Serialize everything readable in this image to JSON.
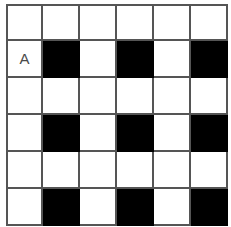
{
  "figure": {
    "kind": "checkerboard-grid",
    "columns": 6,
    "rows": 6,
    "cell_size_px": 37,
    "origin_x_px": 6,
    "origin_y_px": 4,
    "line_width_px": 2,
    "clipped_bottom_row": true
  },
  "colors": {
    "background": "#ffffff",
    "gridline": "#555555",
    "filled_cell": "#000000",
    "empty_cell": "#ffffff",
    "label_text": "#4a4a4a"
  },
  "chart_data": {
    "type": "heatmap",
    "title": "",
    "xlabel": "",
    "ylabel": "",
    "x": [
      1,
      2,
      3,
      4,
      5,
      6
    ],
    "y": [
      1,
      2,
      3,
      4,
      5,
      6
    ],
    "legend": [],
    "grid": true,
    "note": "1 = filled (black) cell, 0 = empty (white) cell; rows listed top to bottom",
    "values": [
      [
        0,
        0,
        0,
        0,
        0,
        0
      ],
      [
        0,
        1,
        0,
        1,
        0,
        1
      ],
      [
        0,
        0,
        0,
        0,
        0,
        0
      ],
      [
        0,
        1,
        0,
        1,
        0,
        1
      ],
      [
        0,
        0,
        0,
        0,
        0,
        0
      ],
      [
        0,
        1,
        0,
        1,
        0,
        1
      ]
    ]
  },
  "annotations": [
    {
      "label": "A",
      "row": 2,
      "col": 1
    }
  ],
  "cells": [
    [
      {
        "filled": false,
        "label": ""
      },
      {
        "filled": false,
        "label": ""
      },
      {
        "filled": false,
        "label": ""
      },
      {
        "filled": false,
        "label": ""
      },
      {
        "filled": false,
        "label": ""
      },
      {
        "filled": false,
        "label": ""
      }
    ],
    [
      {
        "filled": false,
        "label": "A"
      },
      {
        "filled": true,
        "label": ""
      },
      {
        "filled": false,
        "label": ""
      },
      {
        "filled": true,
        "label": ""
      },
      {
        "filled": false,
        "label": ""
      },
      {
        "filled": true,
        "label": ""
      }
    ],
    [
      {
        "filled": false,
        "label": ""
      },
      {
        "filled": false,
        "label": ""
      },
      {
        "filled": false,
        "label": ""
      },
      {
        "filled": false,
        "label": ""
      },
      {
        "filled": false,
        "label": ""
      },
      {
        "filled": false,
        "label": ""
      }
    ],
    [
      {
        "filled": false,
        "label": ""
      },
      {
        "filled": true,
        "label": ""
      },
      {
        "filled": false,
        "label": ""
      },
      {
        "filled": true,
        "label": ""
      },
      {
        "filled": false,
        "label": ""
      },
      {
        "filled": true,
        "label": ""
      }
    ],
    [
      {
        "filled": false,
        "label": ""
      },
      {
        "filled": false,
        "label": ""
      },
      {
        "filled": false,
        "label": ""
      },
      {
        "filled": false,
        "label": ""
      },
      {
        "filled": false,
        "label": ""
      },
      {
        "filled": false,
        "label": ""
      }
    ],
    [
      {
        "filled": false,
        "label": ""
      },
      {
        "filled": true,
        "label": ""
      },
      {
        "filled": false,
        "label": ""
      },
      {
        "filled": true,
        "label": ""
      },
      {
        "filled": false,
        "label": ""
      },
      {
        "filled": true,
        "label": ""
      }
    ]
  ]
}
